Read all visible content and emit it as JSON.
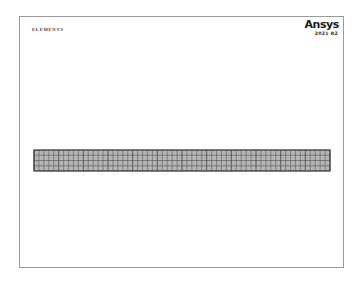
{
  "window": {
    "title": "ELEMENTS"
  },
  "plot": {
    "title_label": "ELEMENTS",
    "background_color": "#ffffff",
    "frame_color": "#9a9a9a",
    "frame": {
      "x": 19,
      "y": 16,
      "width": 325,
      "height": 252
    }
  },
  "branding": {
    "wordmark": "Ansys",
    "version": "2021 R2",
    "wordmark_color": "#1a1a1a"
  },
  "mesh": {
    "name": "beam-element-mesh",
    "description": "Horizontal meshed beam of quadrilateral shell elements",
    "x": 34,
    "y": 150,
    "width": 296,
    "height": 21,
    "columns": 60,
    "rows": 4,
    "line_color": "#4a4a4a",
    "fill_color": "#b5b5b5",
    "edge_color": "#2e2e2e"
  },
  "chart_data": {
    "type": "mesh-plot",
    "title": "ELEMENTS",
    "element_shape": "quadrilateral",
    "columns": 60,
    "rows": 4,
    "total_elements": 240,
    "xlabel": "",
    "ylabel": "",
    "grid": true,
    "legend": "none"
  }
}
